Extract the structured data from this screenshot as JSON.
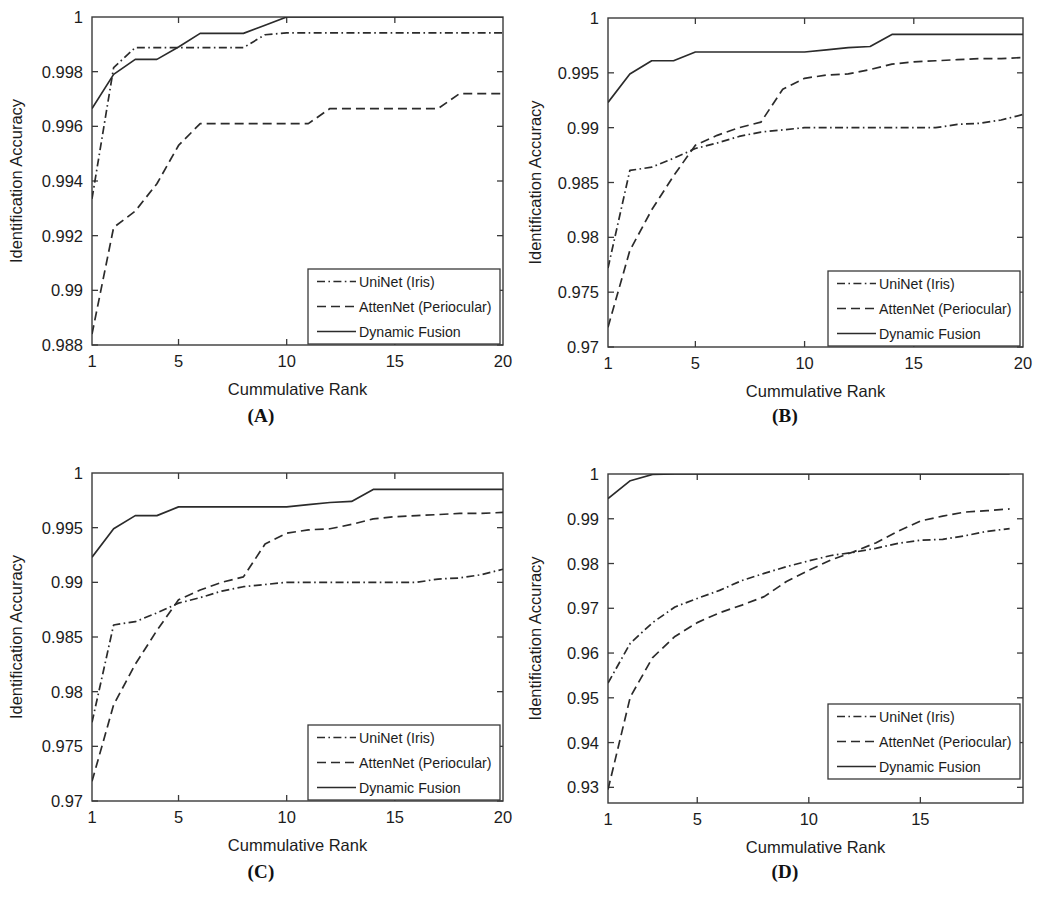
{
  "figure": {
    "background": "#ffffff",
    "line_color": "#2b2b2b",
    "axis_color": "#3a3a3a",
    "panels": [
      {
        "id": "A",
        "caption": "(A)"
      },
      {
        "id": "B",
        "caption": "(B)"
      },
      {
        "id": "C",
        "caption": "(C)"
      },
      {
        "id": "D",
        "caption": "(D)"
      }
    ]
  },
  "legend": {
    "entries": [
      {
        "label": "UniNet (Iris)",
        "style": "dash-dot"
      },
      {
        "label": "AttenNet (Periocular)",
        "style": "dashed"
      },
      {
        "label": "Dynamic Fusion",
        "style": "solid"
      }
    ]
  },
  "chart_data": [
    {
      "type": "line",
      "panel": "A",
      "title": "(A)",
      "xlabel": "Cummulative Rank",
      "ylabel": "Identification Accuracy",
      "xlim": [
        1,
        20
      ],
      "ylim": [
        0.988,
        1.0
      ],
      "xticks": [
        1,
        5,
        10,
        15,
        20
      ],
      "xtick_labels": [
        "1",
        "5",
        "10",
        "15",
        "20"
      ],
      "yticks": [
        0.988,
        0.99,
        0.992,
        0.994,
        0.996,
        0.998,
        1
      ],
      "ytick_labels": [
        "0.988",
        "0.99",
        "0.992",
        "0.994",
        "0.996",
        "0.998",
        "1"
      ],
      "grid": false,
      "legend_position": "lower right",
      "x": [
        1,
        2,
        3,
        4,
        5,
        6,
        7,
        8,
        9,
        10,
        11,
        12,
        13,
        14,
        15,
        16,
        17,
        18,
        19,
        20
      ],
      "series": [
        {
          "name": "UniNet (Iris)",
          "style": "dash-dot",
          "values": [
            0.99335,
            0.99815,
            0.99888,
            0.99888,
            0.99888,
            0.99888,
            0.99888,
            0.99888,
            0.99935,
            0.99942,
            0.99942,
            0.99942,
            0.99942,
            0.99942,
            0.99942,
            0.99942,
            0.99942,
            0.99942,
            0.99942,
            0.99942
          ]
        },
        {
          "name": "AttenNet (Periocular)",
          "style": "dashed",
          "values": [
            0.9884,
            0.9923,
            0.9929,
            0.9939,
            0.9953,
            0.9961,
            0.9961,
            0.9961,
            0.9961,
            0.9961,
            0.9961,
            0.99665,
            0.99665,
            0.99665,
            0.99665,
            0.99665,
            0.99665,
            0.9972,
            0.9972,
            0.9972
          ]
        },
        {
          "name": "Dynamic Fusion",
          "style": "solid",
          "values": [
            0.99665,
            0.9979,
            0.99845,
            0.99845,
            0.9989,
            0.9994,
            0.9994,
            0.9994,
            0.9997,
            1.0,
            1.0,
            1.0,
            1.0,
            1.0,
            1.0,
            1.0,
            1.0,
            1.0,
            1.0,
            1.0
          ]
        }
      ]
    },
    {
      "type": "line",
      "panel": "B",
      "title": "(B)",
      "xlabel": "Cummulative Rank",
      "ylabel": "Identification Accuracy",
      "xlim": [
        1,
        20
      ],
      "ylim": [
        0.97,
        1.0
      ],
      "xticks": [
        1,
        5,
        10,
        15,
        20
      ],
      "xtick_labels": [
        "1",
        "5",
        "10",
        "15",
        "20"
      ],
      "yticks": [
        0.97,
        0.975,
        0.98,
        0.985,
        0.99,
        0.995,
        1
      ],
      "ytick_labels": [
        "0.97",
        "0.975",
        "0.98",
        "0.985",
        "0.99",
        "0.995",
        "1"
      ],
      "grid": false,
      "legend_position": "lower right",
      "x": [
        1,
        2,
        3,
        4,
        5,
        6,
        7,
        8,
        9,
        10,
        11,
        12,
        13,
        14,
        15,
        16,
        17,
        18,
        19,
        20
      ],
      "series": [
        {
          "name": "UniNet (Iris)",
          "style": "dash-dot",
          "values": [
            0.9772,
            0.9861,
            0.9864,
            0.9872,
            0.9881,
            0.9886,
            0.9892,
            0.9896,
            0.9898,
            0.99,
            0.99,
            0.99,
            0.99,
            0.99,
            0.99,
            0.99,
            0.9903,
            0.9904,
            0.9907,
            0.9912
          ]
        },
        {
          "name": "AttenNet (Periocular)",
          "style": "dashed",
          "values": [
            0.9718,
            0.9788,
            0.9825,
            0.9856,
            0.9884,
            0.9893,
            0.99,
            0.9905,
            0.9935,
            0.9945,
            0.9948,
            0.9949,
            0.9953,
            0.9958,
            0.996,
            0.9961,
            0.9962,
            0.9963,
            0.9963,
            0.9964
          ]
        },
        {
          "name": "Dynamic Fusion",
          "style": "solid",
          "values": [
            0.9923,
            0.9949,
            0.9961,
            0.9961,
            0.9969,
            0.9969,
            0.9969,
            0.9969,
            0.9969,
            0.9969,
            0.9971,
            0.9973,
            0.9974,
            0.9985,
            0.9985,
            0.9985,
            0.9985,
            0.9985,
            0.9985,
            0.9985
          ]
        }
      ]
    },
    {
      "type": "line",
      "panel": "C",
      "title": "(C)",
      "xlabel": "Cummulative Rank",
      "ylabel": "Identification Accuracy",
      "xlim": [
        1,
        20
      ],
      "ylim": [
        0.97,
        1.0
      ],
      "xticks": [
        1,
        5,
        10,
        15,
        20
      ],
      "xtick_labels": [
        "1",
        "5",
        "10",
        "15",
        "20"
      ],
      "yticks": [
        0.97,
        0.975,
        0.98,
        0.985,
        0.99,
        0.995,
        1
      ],
      "ytick_labels": [
        "0.97",
        "0.975",
        "0.98",
        "0.985",
        "0.99",
        "0.995",
        "1"
      ],
      "grid": false,
      "legend_position": "lower right",
      "x": [
        1,
        2,
        3,
        4,
        5,
        6,
        7,
        8,
        9,
        10,
        11,
        12,
        13,
        14,
        15,
        16,
        17,
        18,
        19,
        20
      ],
      "series": [
        {
          "name": "UniNet (Iris)",
          "style": "dash-dot",
          "values": [
            0.9772,
            0.9861,
            0.9864,
            0.9872,
            0.9881,
            0.9886,
            0.9892,
            0.9896,
            0.9898,
            0.99,
            0.99,
            0.99,
            0.99,
            0.99,
            0.99,
            0.99,
            0.9903,
            0.9904,
            0.9907,
            0.9912
          ]
        },
        {
          "name": "AttenNet (Periocular)",
          "style": "dashed",
          "values": [
            0.9718,
            0.9788,
            0.9825,
            0.9856,
            0.9884,
            0.9893,
            0.99,
            0.9905,
            0.9935,
            0.9945,
            0.9948,
            0.9949,
            0.9953,
            0.9958,
            0.996,
            0.9961,
            0.9962,
            0.9963,
            0.9963,
            0.9964
          ]
        },
        {
          "name": "Dynamic Fusion",
          "style": "solid",
          "values": [
            0.9923,
            0.9949,
            0.9961,
            0.9961,
            0.9969,
            0.9969,
            0.9969,
            0.9969,
            0.9969,
            0.9969,
            0.9971,
            0.9973,
            0.9974,
            0.9985,
            0.9985,
            0.9985,
            0.9985,
            0.9985,
            0.9985,
            0.9985
          ]
        }
      ]
    },
    {
      "type": "line",
      "panel": "D",
      "title": "(D)",
      "xlabel": "Cummulative Rank",
      "ylabel": "Identification Accuracy",
      "xlim": [
        1,
        19.6
      ],
      "ylim": [
        0.9265,
        1.0
      ],
      "xticks": [
        1,
        5,
        10,
        15
      ],
      "xtick_labels": [
        "1",
        "5",
        "10",
        "15"
      ],
      "yticks": [
        0.93,
        0.94,
        0.95,
        0.96,
        0.97,
        0.98,
        0.99,
        1
      ],
      "ytick_labels": [
        "0.93",
        "0.94",
        "0.95",
        "0.96",
        "0.97",
        "0.98",
        "0.99",
        "1"
      ],
      "grid": false,
      "legend_position": "lower right",
      "x": [
        1,
        2,
        3,
        4,
        5,
        6,
        7,
        8,
        9,
        10,
        11,
        12,
        13,
        14,
        15,
        16,
        17,
        18,
        19
      ],
      "series": [
        {
          "name": "UniNet (Iris)",
          "style": "dash-dot",
          "values": [
            0.9533,
            0.9622,
            0.9668,
            0.9703,
            0.9722,
            0.974,
            0.9762,
            0.9778,
            0.9793,
            0.9806,
            0.9818,
            0.9825,
            0.9834,
            0.9845,
            0.9852,
            0.9854,
            0.9862,
            0.9872,
            0.9878
          ]
        },
        {
          "name": "AttenNet (Periocular)",
          "style": "dashed",
          "values": [
            0.9295,
            0.9502,
            0.959,
            0.9637,
            0.9668,
            0.969,
            0.9707,
            0.9726,
            0.976,
            0.9785,
            0.9808,
            0.9826,
            0.9846,
            0.9872,
            0.9895,
            0.9906,
            0.9915,
            0.9918,
            0.9922
          ]
        },
        {
          "name": "Dynamic Fusion",
          "style": "solid",
          "values": [
            0.9945,
            0.9985,
            0.9999,
            1.0,
            1.0,
            1.0,
            1.0,
            1.0,
            1.0,
            1.0,
            1.0,
            1.0,
            1.0,
            1.0,
            1.0,
            1.0,
            1.0,
            1.0,
            1.0
          ]
        }
      ]
    }
  ]
}
